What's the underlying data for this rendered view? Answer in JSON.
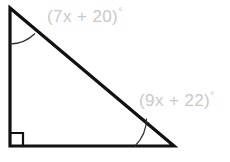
{
  "figure": {
    "type": "right-triangle-angle-diagram",
    "background_color": "#ffffff",
    "stroke_color": "#111111",
    "label_color": "#c9c9c9",
    "vertices": {
      "top_left": [
        10,
        8
      ],
      "bottom_left": [
        10,
        146
      ],
      "bottom_right": [
        174,
        146
      ]
    },
    "labels": {
      "top_angle": "(7x + 20)",
      "right_angle_expr": "(9x + 22)",
      "degree_symbol": "°"
    },
    "marks": {
      "top_left_arc": "angle-arc",
      "bottom_left_square": "right-angle-mark",
      "bottom_right_arc": "angle-arc"
    }
  }
}
